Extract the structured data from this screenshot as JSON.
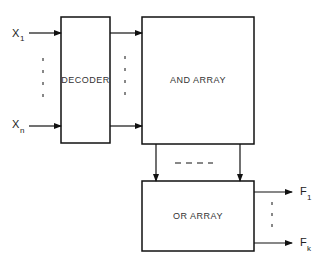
{
  "diagram": {
    "blocks": {
      "decoder": {
        "label": "DECODER"
      },
      "and_array": {
        "label": "AND ARRAY"
      },
      "or_array": {
        "label": "OR ARRAY"
      }
    },
    "inputs": [
      {
        "name": "X",
        "subscript": "1"
      },
      {
        "name": "X",
        "subscript": "n"
      }
    ],
    "outputs": [
      {
        "name": "F",
        "subscript": "1"
      },
      {
        "name": "F",
        "subscript": "k"
      }
    ],
    "colors": {
      "stroke": "#111111",
      "background": "#ffffff"
    }
  }
}
